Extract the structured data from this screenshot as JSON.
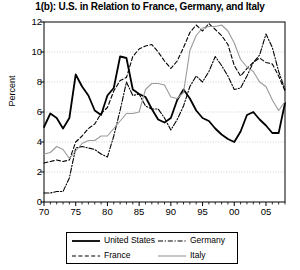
{
  "chart_data": {
    "type": "line",
    "title": "1(b): U.S. in Relation to France, Germany, and Italy",
    "xlabel": "",
    "ylabel": "Percent",
    "ylim": [
      0,
      12
    ],
    "yticks": [
      0,
      2,
      4,
      6,
      8,
      10,
      12
    ],
    "xlim": [
      1970,
      2008
    ],
    "xticks": [
      1970,
      1975,
      1980,
      1985,
      1990,
      1995,
      2000,
      2005
    ],
    "xticklabels": [
      "70",
      "75",
      "80",
      "85",
      "90",
      "95",
      "00",
      "05"
    ],
    "grid": "horizontal-dotted",
    "legend_position": "below-axes",
    "x": [
      1970,
      1971,
      1972,
      1973,
      1974,
      1975,
      1976,
      1977,
      1978,
      1979,
      1980,
      1981,
      1982,
      1983,
      1984,
      1985,
      1986,
      1987,
      1988,
      1989,
      1990,
      1991,
      1992,
      1993,
      1994,
      1995,
      1996,
      1997,
      1998,
      1999,
      2000,
      2001,
      2002,
      2003,
      2004,
      2005,
      2006,
      2007,
      2008
    ],
    "series": [
      {
        "name": "United States",
        "color": "#000000",
        "style": "solid",
        "width": 1.8,
        "values": [
          5.0,
          5.9,
          5.6,
          4.9,
          5.6,
          8.5,
          7.7,
          7.1,
          6.1,
          5.8,
          7.1,
          7.6,
          9.7,
          9.6,
          7.5,
          7.2,
          7.0,
          6.2,
          5.5,
          5.3,
          5.6,
          6.8,
          7.5,
          6.9,
          6.1,
          5.6,
          5.4,
          4.9,
          4.5,
          4.2,
          4.0,
          4.7,
          5.8,
          6.0,
          5.5,
          5.1,
          4.6,
          4.6,
          6.6
        ]
      },
      {
        "name": "France",
        "color": "#000000",
        "style": "dashed",
        "width": 1.1,
        "values": [
          2.6,
          2.7,
          2.8,
          2.7,
          2.8,
          4.0,
          4.4,
          4.9,
          5.2,
          5.9,
          6.3,
          7.4,
          8.1,
          8.3,
          9.7,
          10.2,
          10.4,
          10.5,
          10.0,
          9.4,
          8.9,
          9.4,
          10.3,
          11.3,
          11.8,
          11.4,
          11.9,
          11.5,
          11.1,
          10.5,
          9.1,
          8.4,
          8.9,
          9.3,
          9.6,
          9.3,
          9.2,
          8.4,
          7.4
        ]
      },
      {
        "name": "Germany",
        "color": "#000000",
        "style": "dashdot",
        "width": 1.1,
        "values": [
          0.6,
          0.6,
          0.7,
          0.7,
          1.6,
          3.6,
          3.7,
          3.6,
          3.5,
          3.2,
          3.0,
          4.4,
          6.1,
          8.0,
          7.1,
          7.2,
          6.4,
          6.2,
          6.2,
          5.6,
          4.8,
          5.5,
          6.4,
          7.7,
          8.4,
          8.0,
          8.7,
          9.7,
          9.1,
          8.4,
          7.5,
          7.6,
          8.4,
          9.3,
          9.8,
          11.2,
          10.3,
          8.7,
          7.5
        ]
      },
      {
        "name": "Italy",
        "color": "#9a9a9a",
        "style": "solid-light",
        "width": 1.1,
        "values": [
          3.2,
          3.3,
          3.7,
          3.5,
          2.9,
          3.4,
          3.9,
          4.1,
          4.1,
          4.4,
          4.4,
          4.9,
          5.4,
          5.9,
          5.9,
          6.0,
          7.5,
          7.9,
          7.9,
          7.8,
          7.0,
          6.9,
          7.3,
          10.1,
          11.1,
          11.6,
          11.7,
          11.7,
          11.8,
          11.4,
          10.6,
          9.5,
          9.0,
          8.7,
          8.0,
          7.7,
          6.8,
          6.1,
          6.7
        ]
      }
    ]
  },
  "axes": {
    "ylabel": "Percent",
    "ytick_labels": [
      "0",
      "2",
      "4",
      "6",
      "8",
      "10",
      "12"
    ],
    "xtick_labels": [
      "70",
      "75",
      "80",
      "85",
      "90",
      "95",
      "00",
      "05"
    ]
  },
  "legend": {
    "items": [
      {
        "label": "United States",
        "style": "solid"
      },
      {
        "label": "Germany",
        "style": "dashdot"
      },
      {
        "label": "France",
        "style": "dashed"
      },
      {
        "label": "Italy",
        "style": "solid-light"
      }
    ]
  }
}
